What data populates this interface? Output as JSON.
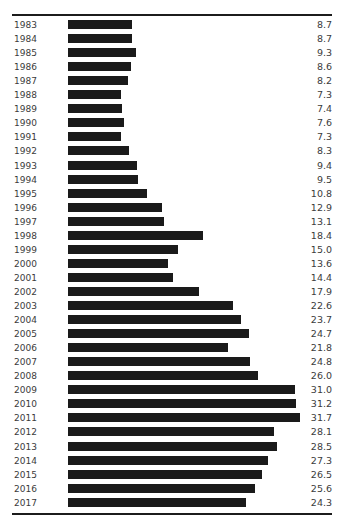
{
  "chart_data": {
    "type": "bar",
    "orientation": "horizontal",
    "title": "",
    "xlabel": "",
    "ylabel": "",
    "grid": false,
    "legend": null,
    "xlim": [
      0,
      31.7
    ],
    "categories": [
      "1983",
      "1984",
      "1985",
      "1986",
      "1987",
      "1988",
      "1989",
      "1990",
      "1991",
      "1992",
      "1993",
      "1994",
      "1995",
      "1996",
      "1997",
      "1998",
      "1999",
      "2000",
      "2001",
      "2002",
      "2003",
      "2004",
      "2005",
      "2006",
      "2007",
      "2008",
      "2009",
      "2010",
      "2011",
      "2012",
      "2013",
      "2014",
      "2015",
      "2016",
      "2017"
    ],
    "values": [
      8.7,
      8.7,
      9.3,
      8.6,
      8.2,
      7.3,
      7.4,
      7.6,
      7.3,
      8.3,
      9.4,
      9.5,
      10.8,
      12.9,
      13.1,
      18.4,
      15.0,
      13.6,
      14.4,
      17.9,
      22.6,
      23.7,
      24.7,
      21.8,
      24.8,
      26.0,
      31.0,
      31.2,
      31.7,
      28.1,
      28.5,
      27.3,
      26.5,
      25.6,
      24.3
    ],
    "value_labels": [
      "8.7",
      "8.7",
      "9.3",
      "8.6",
      "8.2",
      "7.3",
      "7.4",
      "7.6",
      "7.3",
      "8.3",
      "9.4",
      "9.5",
      "10.8",
      "12.9",
      "13.1",
      "18.4",
      "15.0",
      "13.6",
      "14.4",
      "17.9",
      "22.6",
      "23.7",
      "24.7",
      "21.8",
      "24.8",
      "26.0",
      "31.0",
      "31.2",
      "31.7",
      "28.1",
      "28.5",
      "27.3",
      "26.5",
      "25.6",
      "24.3"
    ],
    "bar_color": "#1a1a1a",
    "max_value": 31.7
  },
  "rows": [
    {
      "year": "1983",
      "value": "8.7",
      "num": 8.7
    },
    {
      "year": "1984",
      "value": "8.7",
      "num": 8.7
    },
    {
      "year": "1985",
      "value": "9.3",
      "num": 9.3
    },
    {
      "year": "1986",
      "value": "8.6",
      "num": 8.6
    },
    {
      "year": "1987",
      "value": "8.2",
      "num": 8.2
    },
    {
      "year": "1988",
      "value": "7.3",
      "num": 7.3
    },
    {
      "year": "1989",
      "value": "7.4",
      "num": 7.4
    },
    {
      "year": "1990",
      "value": "7.6",
      "num": 7.6
    },
    {
      "year": "1991",
      "value": "7.3",
      "num": 7.3
    },
    {
      "year": "1992",
      "value": "8.3",
      "num": 8.3
    },
    {
      "year": "1993",
      "value": "9.4",
      "num": 9.4
    },
    {
      "year": "1994",
      "value": "9.5",
      "num": 9.5
    },
    {
      "year": "1995",
      "value": "10.8",
      "num": 10.8
    },
    {
      "year": "1996",
      "value": "12.9",
      "num": 12.9
    },
    {
      "year": "1997",
      "value": "13.1",
      "num": 13.1
    },
    {
      "year": "1998",
      "value": "18.4",
      "num": 18.4
    },
    {
      "year": "1999",
      "value": "15.0",
      "num": 15.0
    },
    {
      "year": "2000",
      "value": "13.6",
      "num": 13.6
    },
    {
      "year": "2001",
      "value": "14.4",
      "num": 14.4
    },
    {
      "year": "2002",
      "value": "17.9",
      "num": 17.9
    },
    {
      "year": "2003",
      "value": "22.6",
      "num": 22.6
    },
    {
      "year": "2004",
      "value": "23.7",
      "num": 23.7
    },
    {
      "year": "2005",
      "value": "24.7",
      "num": 24.7
    },
    {
      "year": "2006",
      "value": "21.8",
      "num": 21.8
    },
    {
      "year": "2007",
      "value": "24.8",
      "num": 24.8
    },
    {
      "year": "2008",
      "value": "26.0",
      "num": 26.0
    },
    {
      "year": "2009",
      "value": "31.0",
      "num": 31.0
    },
    {
      "year": "2010",
      "value": "31.2",
      "num": 31.2
    },
    {
      "year": "2011",
      "value": "31.7",
      "num": 31.7
    },
    {
      "year": "2012",
      "value": "28.1",
      "num": 28.1
    },
    {
      "year": "2013",
      "value": "28.5",
      "num": 28.5
    },
    {
      "year": "2014",
      "value": "27.3",
      "num": 27.3
    },
    {
      "year": "2015",
      "value": "26.5",
      "num": 26.5
    },
    {
      "year": "2016",
      "value": "25.6",
      "num": 25.6
    },
    {
      "year": "2017",
      "value": "24.3",
      "num": 24.3
    }
  ],
  "layout": {
    "row_pitch": 14.05,
    "bar_origin_x": 68,
    "px_per_unit": 7.32
  }
}
